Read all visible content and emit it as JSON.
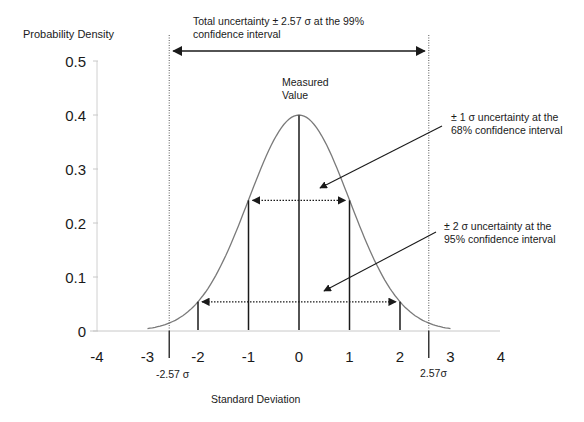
{
  "chart_data": {
    "type": "line",
    "title": "",
    "xlabel": "Standard Deviation",
    "ylabel": "Probability Density",
    "xlim": [
      -4,
      4
    ],
    "ylim": [
      0,
      0.5
    ],
    "x_ticks": [
      -4,
      -3,
      -2,
      -1,
      0,
      1,
      2,
      3,
      4
    ],
    "x_tick_labels": [
      "-4",
      "-3",
      "-2",
      "-1",
      "0",
      "1",
      "2",
      "3",
      "4"
    ],
    "y_ticks": [
      0,
      0.1,
      0.2,
      0.3,
      0.4,
      0.5
    ],
    "y_tick_labels": [
      "0",
      "0.1",
      "0.2",
      "0.3",
      "0.4",
      "0.5"
    ],
    "grid": false,
    "series": [
      {
        "name": "Normal distribution",
        "function": "standard normal pdf",
        "mean": 0,
        "sd": 1,
        "x_range": [
          -3,
          3
        ],
        "peak": 0.4
      }
    ],
    "vertical_markers": [
      {
        "x": 0,
        "label": "Measured Value",
        "style": "solid"
      },
      {
        "x": -1,
        "style": "solid"
      },
      {
        "x": 1,
        "style": "solid"
      },
      {
        "x": -2,
        "style": "solid"
      },
      {
        "x": 2,
        "style": "solid"
      },
      {
        "x": -2.57,
        "label": "-2.57 σ",
        "style": "dotted"
      },
      {
        "x": 2.57,
        "label": "2.57σ",
        "style": "dotted"
      }
    ],
    "intervals": [
      {
        "from": -1,
        "to": 1,
        "level": 0.242,
        "style": "dotted double arrow",
        "label": "± 1 σ  uncertainty at the 68% confidence interval"
      },
      {
        "from": -2,
        "to": 2,
        "level": 0.054,
        "style": "dotted double arrow",
        "label": "± 2 σ  uncertainty at the 95% confidence interval"
      },
      {
        "from": -2.57,
        "to": 2.57,
        "style": "solid double arrow",
        "label": "Total uncertainty ± 2.57 σ  at the 99% confidence interval"
      }
    ]
  },
  "annotations": {
    "total_line1": "Total uncertainty ± 2.57 σ  at the 99%",
    "total_line2": "confidence interval",
    "measured_line1": "Measured",
    "measured_line2": "Value",
    "one_sigma_line1": "± 1 σ  uncertainty at the",
    "one_sigma_line2": "68% confidence interval",
    "two_sigma_line1": "± 2 σ  uncertainty at the",
    "two_sigma_line2": "95% confidence interval",
    "neg_limit": "-2.57 σ",
    "pos_limit": "2.57σ"
  },
  "colors": {
    "curve": "#7a7a7a",
    "lines": "#1a1a1a",
    "axis": "#c8c8c8"
  }
}
